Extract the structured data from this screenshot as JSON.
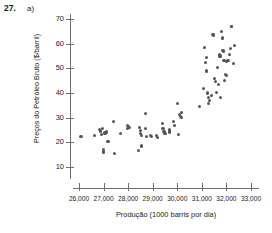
{
  "header": {
    "number": "27.",
    "part": "a)"
  },
  "chart_data": {
    "type": "scatter",
    "title": "",
    "xlabel": "Produção (1000 barris por dia)",
    "ylabel": "Preços do Petróleo Bruto ($/barril)",
    "xlim": [
      25600,
      33400
    ],
    "ylim": [
      6,
      73
    ],
    "grid": false,
    "legend": null,
    "marker_color": "#565656",
    "axis_color": "#6e6e6e",
    "xticks": [
      26000,
      27000,
      28000,
      29000,
      30000,
      31000,
      32000,
      33000
    ],
    "xticklabels": [
      "26,000",
      "27,000",
      "28,000",
      "29,000",
      "30,000",
      "31,000",
      "32,000",
      "33,000"
    ],
    "yticks": [
      10,
      20,
      30,
      40,
      50,
      60,
      70
    ],
    "yticklabels": [
      "10",
      "20",
      "30",
      "40",
      "50",
      "60",
      "70"
    ],
    "series": [
      {
        "name": "Produção vs Preço",
        "points": [
          [
            26080,
            22.5
          ],
          [
            26640,
            22.8
          ],
          [
            26820,
            25.3
          ],
          [
            26880,
            24.6
          ],
          [
            26900,
            23.2
          ],
          [
            26950,
            25.6
          ],
          [
            27000,
            16.2
          ],
          [
            27000,
            15.9
          ],
          [
            27010,
            17.0
          ],
          [
            27060,
            23.8
          ],
          [
            27120,
            24.2
          ],
          [
            27180,
            20.2
          ],
          [
            27400,
            28.3
          ],
          [
            27440,
            15.5
          ],
          [
            27700,
            23.5
          ],
          [
            27960,
            26.7
          ],
          [
            27980,
            25.6
          ],
          [
            28000,
            26.3
          ],
          [
            28060,
            25.9
          ],
          [
            28420,
            16.6
          ],
          [
            28480,
            26.0
          ],
          [
            28500,
            24.8
          ],
          [
            28520,
            23.6
          ],
          [
            28540,
            22.9
          ],
          [
            28560,
            18.5
          ],
          [
            28700,
            31.7
          ],
          [
            28720,
            25.5
          ],
          [
            28760,
            22.2
          ],
          [
            28900,
            22.8
          ],
          [
            28960,
            22.4
          ],
          [
            29160,
            22.6
          ],
          [
            29200,
            22.0
          ],
          [
            29380,
            27.7
          ],
          [
            29420,
            25.6
          ],
          [
            29460,
            24.5
          ],
          [
            29480,
            23.9
          ],
          [
            29500,
            23.7
          ],
          [
            29680,
            25.0
          ],
          [
            29700,
            24.2
          ],
          [
            29840,
            28.5
          ],
          [
            29900,
            27.0
          ],
          [
            30000,
            35.6
          ],
          [
            30060,
            23.2
          ],
          [
            30100,
            31.4
          ],
          [
            30140,
            30.6
          ],
          [
            30160,
            30.0
          ],
          [
            30180,
            32.0
          ],
          [
            30900,
            34.4
          ],
          [
            31080,
            42.0
          ],
          [
            31120,
            58.5
          ],
          [
            31160,
            52.2
          ],
          [
            31180,
            48.9
          ],
          [
            31200,
            54.5
          ],
          [
            31240,
            40.0
          ],
          [
            31260,
            38.2
          ],
          [
            31280,
            35.8
          ],
          [
            31300,
            37.0
          ],
          [
            31400,
            39.0
          ],
          [
            31440,
            63.7
          ],
          [
            31480,
            63.5
          ],
          [
            31520,
            46.0
          ],
          [
            31560,
            44.5
          ],
          [
            31600,
            40.2
          ],
          [
            31640,
            50.4
          ],
          [
            31680,
            43.4
          ],
          [
            31700,
            55.5
          ],
          [
            31720,
            55.2
          ],
          [
            31740,
            55.0
          ],
          [
            31760,
            38.0
          ],
          [
            31800,
            64.8
          ],
          [
            31840,
            62.3
          ],
          [
            31860,
            57.3
          ],
          [
            31880,
            56.8
          ],
          [
            31900,
            53.0
          ],
          [
            31920,
            45.0
          ],
          [
            31960,
            47.5
          ],
          [
            32000,
            47.0
          ],
          [
            32020,
            52.8
          ],
          [
            32060,
            53.2
          ],
          [
            32100,
            53.0
          ],
          [
            32140,
            55.6
          ],
          [
            32180,
            58.2
          ],
          [
            32200,
            67.0
          ],
          [
            32220,
            66.8
          ],
          [
            32280,
            52.0
          ],
          [
            32340,
            59.3
          ]
        ]
      }
    ]
  }
}
